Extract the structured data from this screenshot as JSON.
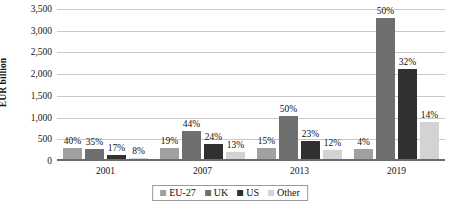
{
  "chart_data": {
    "type": "bar",
    "title": "",
    "xlabel": "",
    "ylabel": "EUR billion",
    "ylim": [
      0,
      3500
    ],
    "ytick_labels": [
      "3,500",
      "3,000",
      "2,500",
      "2,000",
      "1,500",
      "1,000",
      "500",
      "0"
    ],
    "ytick_values": [
      3500,
      3000,
      2500,
      2000,
      1500,
      1000,
      500,
      0
    ],
    "grid": true,
    "legend_position": "bottom",
    "categories": [
      "2001",
      "2007",
      "2013",
      "2019"
    ],
    "series": [
      {
        "name": "EU-27",
        "color": "#a0a0a0",
        "values": [
          300,
          300,
          310,
          270
        ],
        "labels": [
          "40%",
          "19%",
          "15%",
          "4%"
        ]
      },
      {
        "name": "UK",
        "color": "#6f6f6f",
        "values": [
          275,
          700,
          1030,
          3300
        ],
        "labels": [
          "35%",
          "44%",
          "50%",
          "50%"
        ]
      },
      {
        "name": "US",
        "color": "#303030",
        "values": [
          130,
          385,
          470,
          2110
        ],
        "labels": [
          "17%",
          "24%",
          "23%",
          "32%"
        ]
      },
      {
        "name": "Other",
        "color": "#d3d3d3",
        "values": [
          60,
          210,
          245,
          900
        ],
        "labels": [
          "8%",
          "13%",
          "12%",
          "14%"
        ]
      }
    ]
  }
}
